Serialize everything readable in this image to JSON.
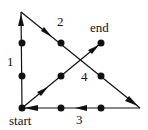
{
  "diagram": {
    "type": "nine-dots-puzzle-solution",
    "colors": {
      "stroke": "#111111",
      "dot": "#111111",
      "background": "#ffffff"
    },
    "dots": [
      {
        "x": 22,
        "y": 43
      },
      {
        "x": 61,
        "y": 43
      },
      {
        "x": 101,
        "y": 43
      },
      {
        "x": 22,
        "y": 76
      },
      {
        "x": 61,
        "y": 76
      },
      {
        "x": 101,
        "y": 76
      },
      {
        "x": 22,
        "y": 108
      },
      {
        "x": 61,
        "y": 108
      },
      {
        "x": 101,
        "y": 108
      }
    ],
    "path": [
      {
        "x": 22,
        "y": 108
      },
      {
        "x": 21,
        "y": 12
      },
      {
        "x": 140,
        "y": 108
      },
      {
        "x": 22,
        "y": 108
      },
      {
        "x": 101,
        "y": 43
      }
    ],
    "segments": [
      {
        "id": "1",
        "label": "1",
        "from": [
          22,
          108
        ],
        "to": [
          21,
          12
        ],
        "label_pos": [
          7,
          58
        ]
      },
      {
        "id": "2",
        "label": "2",
        "from": [
          21,
          12
        ],
        "to": [
          140,
          108
        ],
        "label_pos": [
          57,
          18
        ]
      },
      {
        "id": "3",
        "label": "3",
        "from": [
          140,
          108
        ],
        "to": [
          22,
          108
        ],
        "label_pos": [
          76,
          113
        ]
      },
      {
        "id": "4",
        "label": "4",
        "from": [
          22,
          108
        ],
        "to": [
          101,
          43
        ],
        "label_pos": [
          81,
          72
        ]
      }
    ],
    "labels": {
      "start": "start",
      "end": "end",
      "seg1": "1",
      "seg2": "2",
      "seg3": "3",
      "seg4": "4"
    }
  }
}
